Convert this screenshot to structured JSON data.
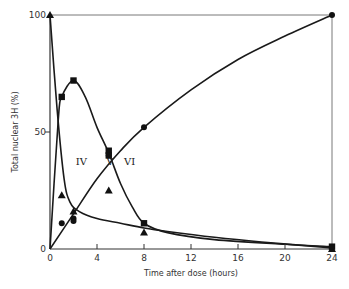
{
  "chart_data": {
    "type": "line",
    "title": "",
    "xlabel": "Time after dose (hours)",
    "ylabel": "Total nuclear 3H (%)",
    "xlim": [
      0,
      24
    ],
    "ylim": [
      0,
      100
    ],
    "x_ticks": [
      0,
      4,
      8,
      12,
      16,
      20,
      24
    ],
    "y_ticks": [
      0,
      50,
      100
    ],
    "grid": false,
    "legend": null,
    "annotations": [
      {
        "text": "IV",
        "x": 2.2,
        "y": 36
      },
      {
        "text": "V",
        "x": 4.8,
        "y": 36
      },
      {
        "text": "VI",
        "x": 6.3,
        "y": 36
      }
    ],
    "series": [
      {
        "name": "IV",
        "marker": "triangle",
        "points": [
          [
            0,
            100
          ],
          [
            1,
            23
          ],
          [
            2,
            16
          ],
          [
            5,
            25
          ],
          [
            8,
            7
          ],
          [
            24,
            0
          ]
        ],
        "curve": [
          [
            0,
            100
          ],
          [
            0.6,
            60
          ],
          [
            1.2,
            30
          ],
          [
            1.7,
            20
          ],
          [
            2.5,
            16
          ],
          [
            4,
            13
          ],
          [
            6,
            11
          ],
          [
            8,
            9
          ],
          [
            10,
            7.5
          ],
          [
            14,
            5
          ],
          [
            18,
            3
          ],
          [
            24,
            0.5
          ]
        ]
      },
      {
        "name": "V",
        "marker": "circle",
        "points": [
          [
            1,
            11
          ],
          [
            2,
            13
          ],
          [
            2,
            12
          ],
          [
            5,
            40
          ],
          [
            8,
            52
          ],
          [
            24,
            100
          ]
        ],
        "curve": [
          [
            0,
            0
          ],
          [
            2,
            15
          ],
          [
            4,
            30
          ],
          [
            6,
            42
          ],
          [
            8,
            52
          ],
          [
            12,
            68
          ],
          [
            16,
            81
          ],
          [
            20,
            91
          ],
          [
            24,
            100
          ]
        ]
      },
      {
        "name": "VI",
        "marker": "square",
        "points": [
          [
            1,
            65
          ],
          [
            2,
            72
          ],
          [
            5,
            42
          ],
          [
            5,
            40
          ],
          [
            8,
            11
          ],
          [
            24,
            1
          ]
        ],
        "curve": [
          [
            0,
            0
          ],
          [
            0.7,
            55
          ],
          [
            1,
            65
          ],
          [
            2,
            72
          ],
          [
            3,
            65
          ],
          [
            4,
            52
          ],
          [
            5,
            41
          ],
          [
            6,
            28
          ],
          [
            7,
            18
          ],
          [
            8,
            11
          ],
          [
            10,
            7
          ],
          [
            14,
            4
          ],
          [
            20,
            2
          ],
          [
            24,
            1
          ]
        ]
      }
    ]
  }
}
